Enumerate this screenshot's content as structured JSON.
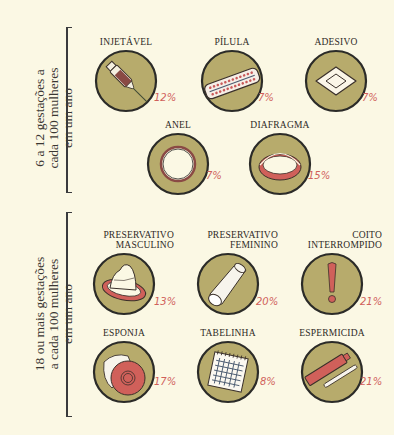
{
  "colors": {
    "background": "#fbf8e4",
    "disc_fill": "#b7ab6c",
    "disc_stroke": "#2b2b28",
    "accent_red": "#d0605a",
    "text": "#2e2a26"
  },
  "groups": [
    {
      "label_lines": [
        "6 a 12 gestações a",
        "cada 100 mulheres",
        "em um ano"
      ],
      "methods": [
        {
          "name": "INJETÁVEL",
          "percent": "12%",
          "icon": "syringe-icon"
        },
        {
          "name": "PÍLULA",
          "percent": "7%",
          "icon": "pill-pack-icon"
        },
        {
          "name": "ADESIVO",
          "percent": "7%",
          "icon": "patch-icon"
        },
        {
          "name": "ANEL",
          "percent": "7%",
          "icon": "vaginal-ring-icon"
        },
        {
          "name": "DIAFRAGMA",
          "percent": "15%",
          "icon": "diaphragm-icon"
        }
      ]
    },
    {
      "label_lines": [
        "18 ou mais gestações",
        "a cada 100 mulheres",
        "em um ano"
      ],
      "methods": [
        {
          "name_lines": [
            "PRESERVATIVO",
            "MASCULINO"
          ],
          "percent": "13%",
          "icon": "male-condom-icon"
        },
        {
          "name_lines": [
            "PRESERVATIVO",
            "FEMININO"
          ],
          "percent": "20%",
          "icon": "female-condom-icon"
        },
        {
          "name_lines": [
            "COITO",
            "INTERROMPIDO"
          ],
          "percent": "21%",
          "icon": "exclamation-icon"
        },
        {
          "name": "ESPONJA",
          "percent": "17%",
          "icon": "sponge-icon"
        },
        {
          "name": "TABELINHA",
          "percent": "8%",
          "icon": "calendar-icon"
        },
        {
          "name": "ESPERMICIDA",
          "percent": "21%",
          "icon": "spermicide-tube-icon"
        }
      ]
    }
  ]
}
